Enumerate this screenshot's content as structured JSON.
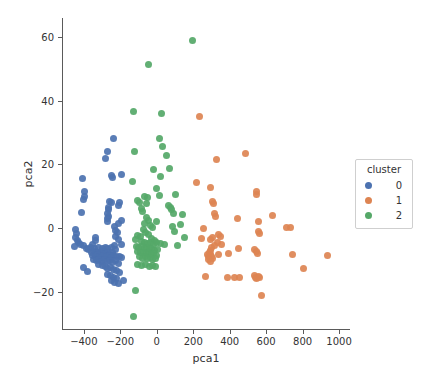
{
  "chart_data": {
    "type": "scatter",
    "title": "",
    "xlabel": "pca1",
    "ylabel": "pca2",
    "xlim": [
      -520,
      1060
    ],
    "ylim": [
      -32,
      66
    ],
    "xticks": [
      -400,
      -200,
      0,
      200,
      400,
      600,
      800,
      1000
    ],
    "xticklabels": [
      "−400",
      "−200",
      "0",
      "200",
      "400",
      "600",
      "800",
      "1000"
    ],
    "yticks": [
      -20,
      0,
      20,
      40,
      60
    ],
    "yticklabels": [
      "−20",
      "0",
      "20",
      "40",
      "60"
    ],
    "grid": false,
    "legend": {
      "title": "cluster",
      "position": "right-outside",
      "entries": [
        {
          "label": "0",
          "color": "#4C72B0"
        },
        {
          "label": "1",
          "color": "#DD8452"
        },
        {
          "label": "2",
          "color": "#55A868"
        }
      ]
    },
    "colors": {
      "cluster_0": "#4C72B0",
      "cluster_1": "#DD8452",
      "cluster_2": "#55A868",
      "axis": "#5a5a5a",
      "text": "#333333",
      "background": "#ffffff"
    },
    "series": [
      {
        "name": "0",
        "color": "#4C72B0",
        "points": [
          [
            -238,
            28
          ],
          [
            -268,
            24
          ],
          [
            -284,
            22
          ],
          [
            -196,
            17
          ],
          [
            -246,
            16.5
          ],
          [
            -243,
            15.8
          ],
          [
            -410,
            15.5
          ],
          [
            -398,
            11.5
          ],
          [
            -396,
            10
          ],
          [
            -401,
            9
          ],
          [
            -258,
            8.5
          ],
          [
            -248,
            8.2
          ],
          [
            -202,
            8
          ],
          [
            -210,
            7
          ],
          [
            -266,
            6.5
          ],
          [
            -263,
            5.8
          ],
          [
            -412,
            5
          ],
          [
            -268,
            4.5
          ],
          [
            -265,
            3.8
          ],
          [
            -270,
            3.0
          ],
          [
            -196,
            2.5
          ],
          [
            -208,
            1.5
          ],
          [
            -268,
            2.2
          ],
          [
            -232,
            0.5
          ],
          [
            -445,
            -0.5
          ],
          [
            -226,
            -0.8
          ],
          [
            -441,
            -1.8
          ],
          [
            -214,
            -1.5
          ],
          [
            -228,
            -2.5
          ],
          [
            -446,
            -3.0
          ],
          [
            -209,
            -3.5
          ],
          [
            -436,
            -3.8
          ],
          [
            -335,
            -3.0
          ],
          [
            -428,
            -4.5
          ],
          [
            -452,
            -5.8
          ],
          [
            -418,
            -5.0
          ],
          [
            -338,
            -4.0
          ],
          [
            -404,
            -5.5
          ],
          [
            -352,
            -5.0
          ],
          [
            -230,
            -5.5
          ],
          [
            -196,
            -5.0
          ],
          [
            -388,
            -6.5
          ],
          [
            -362,
            -6.0
          ],
          [
            -374,
            -6.8
          ],
          [
            -344,
            -6.5
          ],
          [
            -318,
            -6.0
          ],
          [
            -300,
            -6.5
          ],
          [
            -284,
            -6.0
          ],
          [
            -268,
            -6.5
          ],
          [
            -249,
            -6.2
          ],
          [
            -226,
            -6.8
          ],
          [
            -356,
            -7.5
          ],
          [
            -342,
            -7.2
          ],
          [
            -330,
            -7.8
          ],
          [
            -318,
            -7.5
          ],
          [
            -306,
            -7.9
          ],
          [
            -294,
            -7.4
          ],
          [
            -282,
            -8.0
          ],
          [
            -270,
            -7.6
          ],
          [
            -256,
            -8.2
          ],
          [
            -244,
            -7.8
          ],
          [
            -352,
            -8.6
          ],
          [
            -338,
            -8.9
          ],
          [
            -326,
            -8.4
          ],
          [
            -314,
            -8.8
          ],
          [
            -302,
            -9.2
          ],
          [
            -290,
            -8.6
          ],
          [
            -276,
            -9.0
          ],
          [
            -262,
            -8.7
          ],
          [
            -250,
            -9.3
          ],
          [
            -238,
            -8.5
          ],
          [
            -221,
            -8.8
          ],
          [
            -206,
            -9.0
          ],
          [
            -192,
            -9.2
          ],
          [
            -346,
            -9.8
          ],
          [
            -332,
            -10.2
          ],
          [
            -318,
            -9.9
          ],
          [
            -304,
            -10.4
          ],
          [
            -288,
            -10.0
          ],
          [
            -272,
            -10.6
          ],
          [
            -258,
            -10.1
          ],
          [
            -242,
            -10.8
          ],
          [
            -228,
            -10.3
          ],
          [
            -212,
            -11.0
          ],
          [
            -320,
            -11.4
          ],
          [
            -300,
            -11.8
          ],
          [
            -284,
            -12.2
          ],
          [
            -400,
            -12.5
          ],
          [
            -268,
            -12.8
          ],
          [
            -252,
            -12.4
          ],
          [
            -236,
            -13.0
          ],
          [
            -382,
            -13.5
          ],
          [
            -220,
            -13.4
          ],
          [
            -205,
            -13.8
          ],
          [
            -270,
            -14.5
          ],
          [
            -252,
            -15.0
          ],
          [
            -236,
            -15.4
          ],
          [
            -222,
            -15.8
          ],
          [
            -246,
            -16.5
          ],
          [
            -230,
            -17.0
          ],
          [
            -184,
            -16.5
          ],
          [
            -212,
            -17.4
          ]
        ]
      },
      {
        "name": "1",
        "color": "#DD8452",
        "points": [
          [
            236,
            35
          ],
          [
            487,
            23.5
          ],
          [
            326,
            21.5
          ],
          [
            545,
            11.5
          ],
          [
            549,
            10.5
          ],
          [
            306,
            8.5
          ],
          [
            310,
            7.8
          ],
          [
            216,
            14.2
          ],
          [
            292,
            12.8
          ],
          [
            637,
            4.0
          ],
          [
            442,
            3.0
          ],
          [
            556,
            2.0
          ],
          [
            712,
            0.2
          ],
          [
            735,
            0.1
          ],
          [
            316,
            4.5
          ],
          [
            322,
            3.6
          ],
          [
            254,
            -0.2
          ],
          [
            338,
            -2.0
          ],
          [
            352,
            -2.5
          ],
          [
            306,
            -3.0
          ],
          [
            296,
            -3.5
          ],
          [
            248,
            -3.2
          ],
          [
            560,
            -1.2
          ],
          [
            566,
            -1.8
          ],
          [
            332,
            -4.5
          ],
          [
            318,
            -5.5
          ],
          [
            356,
            -5.2
          ],
          [
            302,
            -6.2
          ],
          [
            296,
            -7.0
          ],
          [
            288,
            -7.6
          ],
          [
            292,
            -8.2
          ],
          [
            300,
            -8.8
          ],
          [
            306,
            -9.4
          ],
          [
            286,
            -9.0
          ],
          [
            278,
            -8.4
          ],
          [
            340,
            -8.2
          ],
          [
            392,
            -8.0
          ],
          [
            447,
            -6.5
          ],
          [
            536,
            -6.8
          ],
          [
            545,
            -7.4
          ],
          [
            552,
            -8.0
          ],
          [
            746,
            -8.4
          ],
          [
            938,
            -8.5
          ],
          [
            284,
            -10.0
          ],
          [
            296,
            -10.4
          ],
          [
            268,
            -15.2
          ],
          [
            386,
            -15.6
          ],
          [
            424,
            -15.4
          ],
          [
            452,
            -15.5
          ],
          [
            534,
            -14.8
          ],
          [
            541,
            -15.4
          ],
          [
            548,
            -15.9
          ],
          [
            556,
            -15.2
          ],
          [
            566,
            -15.6
          ],
          [
            804,
            -12.8
          ],
          [
            572,
            -21.3
          ]
        ]
      },
      {
        "name": "2",
        "color": "#55A868",
        "points": [
          [
            196,
            58.8
          ],
          [
            -46,
            51.5
          ],
          [
            -130,
            36.5
          ],
          [
            24,
            36
          ],
          [
            16,
            28
          ],
          [
            -120,
            24
          ],
          [
            34,
            25.5
          ],
          [
            52,
            22.8
          ],
          [
            70,
            18.8
          ],
          [
            -16,
            18.5
          ],
          [
            20,
            16.2
          ],
          [
            -132,
            14.8
          ],
          [
            -2,
            12.5
          ],
          [
            -68,
            10
          ],
          [
            14,
            10.2
          ],
          [
            104,
            10.5
          ],
          [
            -50,
            9.5
          ],
          [
            -104,
            8.8
          ],
          [
            -96,
            8.2
          ],
          [
            -58,
            7.8
          ],
          [
            62,
            7.2
          ],
          [
            76,
            6.5
          ],
          [
            -86,
            6.2
          ],
          [
            82,
            5.8
          ],
          [
            -80,
            5.2
          ],
          [
            90,
            4.5
          ],
          [
            142,
            4.2
          ],
          [
            -54,
            3.2
          ],
          [
            -44,
            2.5
          ],
          [
            0,
            2.0
          ],
          [
            -68,
            1.5
          ],
          [
            128,
            1.2
          ],
          [
            -34,
            0.8
          ],
          [
            -26,
            0.2
          ],
          [
            84,
            0.5
          ],
          [
            -74,
            -0.5
          ],
          [
            96,
            -1.0
          ],
          [
            -62,
            -1.5
          ],
          [
            -48,
            -2.0
          ],
          [
            -106,
            -2.2
          ],
          [
            -90,
            -2.5
          ],
          [
            152,
            -3.0
          ],
          [
            -30,
            -3.2
          ],
          [
            -118,
            -3.5
          ],
          [
            -12,
            -3.8
          ],
          [
            -82,
            -4.2
          ],
          [
            -66,
            -4.5
          ],
          [
            -50,
            -4.8
          ],
          [
            -36,
            -4.5
          ],
          [
            -20,
            -5.0
          ],
          [
            -4,
            -4.6
          ],
          [
            18,
            -4.9
          ],
          [
            40,
            -5.2
          ],
          [
            116,
            -5.4
          ],
          [
            -112,
            -5.8
          ],
          [
            -98,
            -6.2
          ],
          [
            -84,
            -5.9
          ],
          [
            -70,
            -6.5
          ],
          [
            -56,
            -6.1
          ],
          [
            -42,
            -6.8
          ],
          [
            -28,
            -6.4
          ],
          [
            -14,
            -7.0
          ],
          [
            2,
            -6.6
          ],
          [
            -104,
            -7.4
          ],
          [
            -88,
            -7.8
          ],
          [
            -72,
            -7.5
          ],
          [
            -58,
            -8.1
          ],
          [
            -44,
            -7.7
          ],
          [
            -30,
            -8.4
          ],
          [
            -16,
            -8.0
          ],
          [
            -2,
            -8.6
          ],
          [
            -96,
            -9.0
          ],
          [
            -80,
            -9.4
          ],
          [
            -64,
            -9.0
          ],
          [
            -50,
            -9.6
          ],
          [
            -36,
            -9.2
          ],
          [
            -22,
            -9.8
          ],
          [
            -8,
            -9.4
          ],
          [
            -108,
            -11.5
          ],
          [
            -86,
            -11.8
          ],
          [
            -62,
            -11.4
          ],
          [
            -40,
            -12.0
          ],
          [
            -22,
            -11.6
          ],
          [
            -8,
            -12.2
          ],
          [
            -118,
            -19.5
          ],
          [
            -126,
            -27.8
          ]
        ]
      }
    ]
  }
}
